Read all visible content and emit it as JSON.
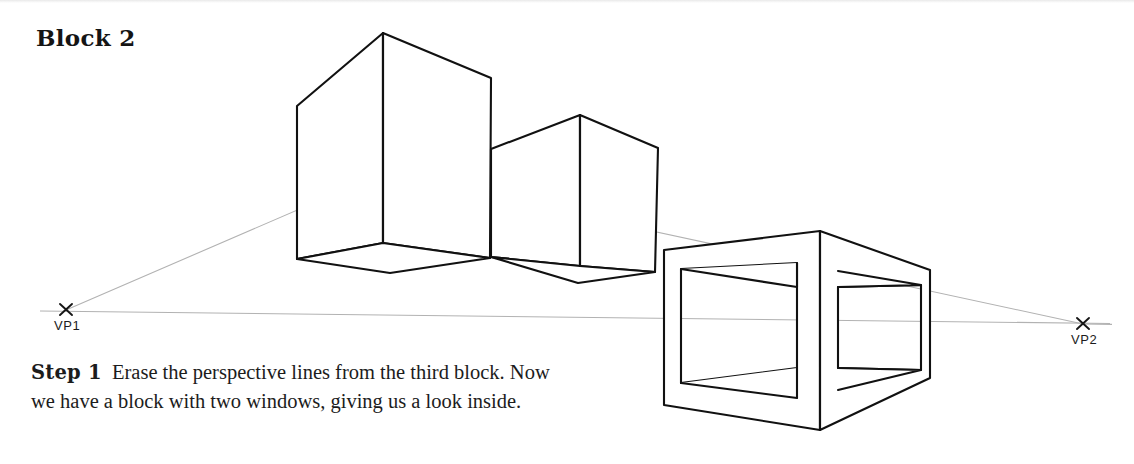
{
  "page": {
    "title": "Block 2",
    "background_color": "#ffffff",
    "ink_color": "#111111",
    "guide_color": "#b4b4b4",
    "width": 1134,
    "height": 464
  },
  "caption": {
    "step_label": "Step 1",
    "body": "Erase the perspective lines from the third block. Now we have a block with two windows, giving us a look inside."
  },
  "vanishing_points": [
    {
      "id": "vp1",
      "label": "VP1",
      "x": 66,
      "y": 310
    },
    {
      "id": "vp2",
      "label": "VP2",
      "x": 1083,
      "y": 324
    }
  ],
  "figure": {
    "horizon": {
      "from_x": 40,
      "from_y": 311,
      "to_x": 1110,
      "to_y": 324
    },
    "guides": [
      {
        "name": "vp1-upper-guide",
        "points": "66,310 383,173 1083,324"
      },
      {
        "name": "vp1-horizon-guide",
        "points": "40,311 1110,323"
      }
    ],
    "blocks": [
      {
        "name": "block-one",
        "apex": "383,33",
        "outline": "297,106 383,33 491,78 491,258 383,273 297,259",
        "front_edge": "383,33 383,243",
        "bottom_face": "297,259 383,244 490,258 390,273"
      },
      {
        "name": "block-two",
        "apex": "580,115",
        "outline": "491,149 580,115 658,148 655,272 578,283 491,257",
        "front_edge": "580,115 580,266",
        "bottom_face": "491,257 578,266 655,272 578,283"
      },
      {
        "name": "block-three-open-frame",
        "outline": "664,250 820,231 930,270 930,378 820,430 664,405",
        "front_edge": "820,231 820,430",
        "windows": [
          {
            "name": "left-window",
            "quad": "681,269 797,263 797,368 681,383"
          },
          {
            "name": "right-window",
            "quad": "838,287 921,285 921,370 838,368"
          }
        ]
      }
    ]
  }
}
